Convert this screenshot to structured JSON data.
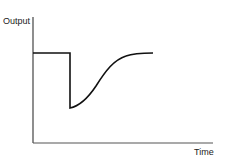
{
  "diagram": {
    "type": "step-response-sketch",
    "y_axis_label": "Output",
    "x_axis_label": "Time",
    "curve": {
      "description": "Output holds a constant level, drops abruptly, then recovers along an S-shaped curve to approximately the original level",
      "segments": [
        "constant",
        "sudden-drop",
        "s-curve-recovery"
      ]
    },
    "colors": {
      "axis": "#555555",
      "curve": "#111111",
      "text": "#222222"
    }
  }
}
